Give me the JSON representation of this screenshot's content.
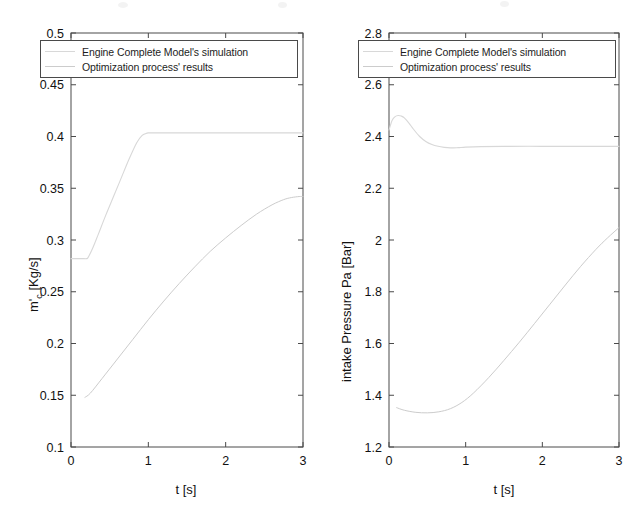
{
  "figure": {
    "background_color": "#ffffff",
    "axis_color": "#4a4a4a",
    "text_color": "#111111"
  },
  "legend": {
    "entries": [
      {
        "label": "Engine Complete Model's simulation",
        "color": "#d8d8d8",
        "style": "solid"
      },
      {
        "label": "Optimization process' results",
        "color": "#cccccc",
        "style": "solid"
      }
    ]
  },
  "chart_data": [
    {
      "type": "line",
      "id": "compressor-mass-flow",
      "title": "",
      "xlabel": "t [s]",
      "ylabel": "m'_c  [Kg/s]",
      "ylabel_main": "m",
      "ylabel_sub": "c",
      "ylabel_unit": " [Kg/s]",
      "xlim": [
        0,
        3
      ],
      "ylim": [
        0.1,
        0.5
      ],
      "xticks": [
        0,
        1,
        2,
        3
      ],
      "xticklabels": [
        "0",
        "1",
        "2",
        "3"
      ],
      "yticks": [
        0.1,
        0.15,
        0.2,
        0.25,
        0.3,
        0.35,
        0.4,
        0.45,
        0.5
      ],
      "yticklabels": [
        "0.1",
        "0.15",
        "0.2",
        "0.25",
        "0.3",
        "0.35",
        "0.4",
        "0.45",
        "0.5"
      ],
      "grid": false,
      "legend_position": "top-left",
      "series": [
        {
          "name": "Engine Complete Model's simulation",
          "color": "#d8d8d8",
          "x": [
            0,
            0.05,
            0.1,
            0.15,
            0.2,
            0.22,
            0.28,
            0.35,
            0.45,
            0.55,
            0.65,
            0.75,
            0.85,
            0.92,
            0.97,
            1.0,
            1.05,
            1.3,
            1.6,
            2.0,
            2.4,
            2.8,
            3.0
          ],
          "y": [
            0.282,
            0.282,
            0.282,
            0.282,
            0.282,
            0.283,
            0.292,
            0.305,
            0.324,
            0.342,
            0.36,
            0.378,
            0.394,
            0.401,
            0.403,
            0.4035,
            0.4035,
            0.4035,
            0.4035,
            0.4035,
            0.4035,
            0.4035,
            0.4035
          ]
        },
        {
          "name": "Optimization process' results",
          "color": "#cccccc",
          "x": [
            0.18,
            0.25,
            0.4,
            0.6,
            0.8,
            1.0,
            1.2,
            1.4,
            1.6,
            1.8,
            2.0,
            2.2,
            2.4,
            2.6,
            2.75,
            2.85,
            2.95,
            3.0
          ],
          "y": [
            0.148,
            0.152,
            0.166,
            0.185,
            0.204,
            0.223,
            0.241,
            0.258,
            0.274,
            0.289,
            0.302,
            0.314,
            0.325,
            0.334,
            0.339,
            0.341,
            0.342,
            0.342
          ]
        }
      ]
    },
    {
      "type": "line",
      "id": "intake-pressure",
      "title": "",
      "xlabel": "t [s]",
      "ylabel": "intake Pressure Pa [Bar]",
      "xlim": [
        0,
        3
      ],
      "ylim": [
        1.2,
        2.8
      ],
      "xticks": [
        0,
        1,
        2,
        3
      ],
      "xticklabels": [
        "0",
        "1",
        "2",
        "3"
      ],
      "yticks": [
        1.2,
        1.4,
        1.6,
        1.8,
        2.0,
        2.2,
        2.4,
        2.6,
        2.8
      ],
      "yticklabels": [
        "1.2",
        "1.4",
        "1.6",
        "1.8",
        "2",
        "2.2",
        "2.4",
        "2.6",
        "2.8"
      ],
      "grid": false,
      "legend_position": "top-left",
      "series": [
        {
          "name": "Engine Complete Model's simulation",
          "color": "#d8d8d8",
          "x": [
            0,
            0.04,
            0.08,
            0.12,
            0.16,
            0.2,
            0.26,
            0.32,
            0.4,
            0.48,
            0.56,
            0.64,
            0.72,
            0.8,
            0.9,
            1.0,
            1.2,
            1.5,
            2.0,
            2.5,
            3.0
          ],
          "y": [
            2.425,
            2.462,
            2.477,
            2.481,
            2.479,
            2.472,
            2.452,
            2.428,
            2.4,
            2.381,
            2.369,
            2.362,
            2.358,
            2.356,
            2.357,
            2.359,
            2.361,
            2.362,
            2.362,
            2.362,
            2.362
          ]
        },
        {
          "name": "Optimization process' results",
          "color": "#cccccc",
          "x": [
            0.1,
            0.2,
            0.35,
            0.5,
            0.65,
            0.8,
            0.95,
            1.1,
            1.3,
            1.5,
            1.7,
            1.9,
            2.1,
            2.3,
            2.5,
            2.7,
            2.85,
            3.0
          ],
          "y": [
            1.352,
            1.342,
            1.334,
            1.332,
            1.336,
            1.348,
            1.372,
            1.408,
            1.468,
            1.535,
            1.605,
            1.678,
            1.752,
            1.826,
            1.898,
            1.964,
            2.008,
            2.048
          ]
        }
      ]
    }
  ]
}
